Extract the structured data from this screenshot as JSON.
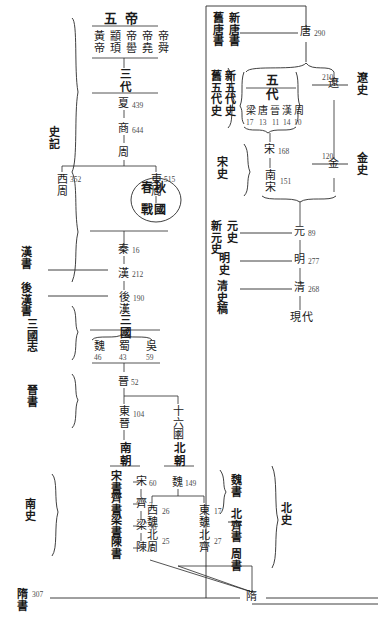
{
  "histories": {
    "shiji": "史記",
    "hanshu": "漢書",
    "houhanshu": "後漢書",
    "sanguozhi": "三國志",
    "jinshu": "晉書",
    "nanshi": "南史",
    "songshu": "宋書",
    "qishu": "齊書",
    "liangshu": "梁書",
    "chenshu": "陳書",
    "weishu": "魏書",
    "beiqishu": "北齊書",
    "zhoushu": "周書",
    "beishi": "北史",
    "suishu": "隋書",
    "jiutangshu": "舊唐書",
    "xintangshu": "新唐書",
    "jiuwudaishi": "舊五代史",
    "xinwudaishi": "新五代史",
    "songshi": "宋史",
    "liaoshi": "遼史",
    "jinshi": "金史",
    "xinyuanshi": "新元史",
    "yuanshi": "元史",
    "mingshi": "明史",
    "qingshigao": "清史稿"
  },
  "left_column": {
    "wudi_header": "五帝",
    "wudi": [
      "黃帝",
      "顓頊",
      "帝嚳",
      "帝堯",
      "帝舜"
    ],
    "sandai_header": "三代",
    "sandai": [
      {
        "name": "夏",
        "years": "439"
      },
      {
        "name": "商",
        "years": "644"
      },
      {
        "name": "周",
        "years": ""
      }
    ],
    "zhou_split": [
      {
        "name": "西周",
        "years": "352"
      },
      {
        "name": "東周",
        "years": "515"
      }
    ],
    "chunqiu_zhanguo": [
      "春秋",
      "戰國"
    ],
    "imperial_chain": [
      {
        "name": "秦",
        "years": "16"
      },
      {
        "name": "漢",
        "years": "212"
      },
      {
        "name": "後漢",
        "years": "190"
      },
      {
        "name": "三國",
        "years": ""
      }
    ],
    "sanguo": [
      {
        "name": "魏",
        "years": "46"
      },
      {
        "name": "蜀",
        "years": "43"
      },
      {
        "name": "吳",
        "years": "59"
      }
    ],
    "jin": [
      {
        "name": "晉",
        "years": "52"
      },
      {
        "name": "東晉",
        "years": "104"
      }
    ],
    "nanbei_headers": [
      "南朝",
      "十六國",
      "北朝"
    ],
    "nanchao": [
      {
        "name": "宋",
        "years": "60"
      },
      {
        "name": "齊",
        "years": "3"
      },
      {
        "name": "梁",
        "years": "56"
      },
      {
        "name": "陳",
        "years": "3"
      }
    ],
    "beichao_root": {
      "name": "魏",
      "years": "149"
    },
    "beichao": [
      {
        "name": "西魏",
        "years": "26"
      },
      {
        "name": "北周",
        "years": "25"
      },
      {
        "name": "東魏",
        "years": "17"
      },
      {
        "name": "北齊",
        "years": "27"
      }
    ],
    "sui": {
      "name": "隋",
      "years": "307"
    }
  },
  "right_column": {
    "tang": {
      "name": "唐",
      "years": "290"
    },
    "wudai_header": "五代",
    "wudai": [
      {
        "name": "梁",
        "years": "17"
      },
      {
        "name": "唐",
        "years": "13"
      },
      {
        "name": "晉",
        "years": "11"
      },
      {
        "name": "漢",
        "years": "14"
      },
      {
        "name": "周",
        "years": "10"
      }
    ],
    "song": [
      {
        "name": "宋",
        "years": "168"
      },
      {
        "name": "南宋",
        "years": "151"
      }
    ],
    "liao": {
      "name": "遼",
      "years": "210"
    },
    "jin": {
      "name": "金",
      "years": "120"
    },
    "later": [
      {
        "name": "元",
        "years": "89"
      },
      {
        "name": "明",
        "years": "277"
      },
      {
        "name": "清",
        "years": "268"
      },
      {
        "name": "現代",
        "years": ""
      }
    ]
  },
  "colors": {
    "ink": "#1a1a1a",
    "line": "#2a2a2a",
    "number": "#4a4a4a",
    "background": "#ffffff"
  }
}
